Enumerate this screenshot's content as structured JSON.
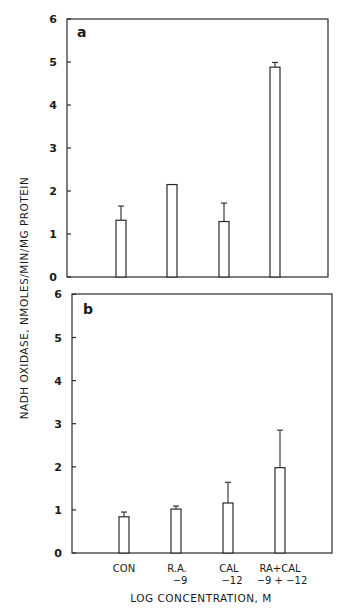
{
  "chart_data": [
    {
      "type": "bar",
      "panel": "a",
      "panel_label": "a",
      "categories": [
        "CON",
        "R.A. -9",
        "CAL -12",
        "RA+CAL -9 + -12"
      ],
      "values": [
        1.32,
        2.15,
        1.29,
        4.88
      ],
      "error_upper": [
        1.65,
        2.15,
        1.72,
        4.99
      ],
      "ylabel": "NADH OXIDASE, NMOLES/MIN/MG PROTEIN",
      "xlabel": "",
      "ylim": [
        0,
        6
      ],
      "yticks": [
        0,
        1,
        2,
        3,
        4,
        5,
        6
      ],
      "grid": false,
      "legend": null
    },
    {
      "type": "bar",
      "panel": "b",
      "panel_label": "b",
      "categories": [
        "CON",
        "R.A. -9",
        "CAL -12",
        "RA+CAL -9 + -12"
      ],
      "values": [
        0.84,
        1.02,
        1.16,
        1.98
      ],
      "error_upper": [
        0.95,
        1.09,
        1.64,
        2.85
      ],
      "ylabel": "NADH OXIDASE, NMOLES/MIN/MG PROTEIN",
      "xlabel": "LOG CONCENTRATION, M",
      "ylim": [
        0,
        6
      ],
      "yticks": [
        0,
        1,
        2,
        3,
        4,
        5,
        6
      ],
      "grid": false,
      "legend": null
    }
  ],
  "labels": {
    "ylabel": "NADH OXIDASE, NMOLES/MIN/MG PROTEIN",
    "xlabel": "LOG CONCENTRATION, M",
    "panel_a": "a",
    "panel_b": "b",
    "categories": [
      {
        "line1": "CON",
        "line2": ""
      },
      {
        "line1": "R.A.",
        "line2": "−9"
      },
      {
        "line1": "CAL",
        "line2": "−12"
      },
      {
        "line1": "RA+CAL",
        "line2": "−9 + −12"
      }
    ],
    "yticks": [
      "0",
      "1",
      "2",
      "3",
      "4",
      "5",
      "6"
    ]
  }
}
